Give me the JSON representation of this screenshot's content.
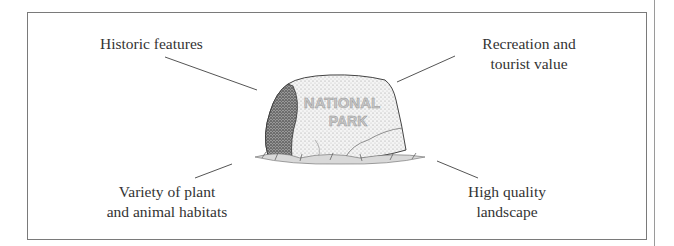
{
  "diagram": {
    "title": "National Park",
    "center": {
      "object": "boulder",
      "inscription": [
        "NATIONAL",
        "PARK"
      ]
    },
    "labels": {
      "top_left": [
        "Historic features"
      ],
      "top_right": [
        "Recreation and",
        "tourist value"
      ],
      "bottom_left": [
        "Variety of plant",
        "and animal habitats"
      ],
      "bottom_right": [
        "High quality",
        "landscape"
      ]
    },
    "colors": {
      "text": "#333333",
      "line": "#555555",
      "border": "#7a7a7a"
    }
  }
}
